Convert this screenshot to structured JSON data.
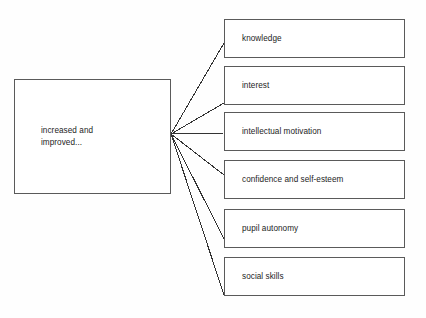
{
  "diagram": {
    "type": "radial-fan-flowchart",
    "title": "",
    "background_color": "#fefefe",
    "box_border_color": "#5a5a5a",
    "box_fill_color": "#ffffff",
    "connector_color": "#333333",
    "text_color": "#1d1d1d",
    "source": {
      "id": "source",
      "label": "increased and\nimproved...",
      "x": 14,
      "y": 79,
      "width": 157,
      "height": 115
    },
    "fan_origin": {
      "x": 171,
      "y": 134
    },
    "targets": [
      {
        "id": "knowledge",
        "label": "knowledge",
        "x": 224,
        "y": 19,
        "width": 181,
        "height": 39,
        "connector_end_x": 224,
        "connector_end_y": 43
      },
      {
        "id": "interest",
        "label": "interest",
        "x": 224,
        "y": 66,
        "width": 181,
        "height": 39,
        "connector_end_x": 224,
        "connector_end_y": 103
      },
      {
        "id": "intellectual-motivation",
        "label": "intellectual motivation",
        "x": 224,
        "y": 112,
        "width": 181,
        "height": 39,
        "connector_end_x": 224,
        "connector_end_y": 133
      },
      {
        "id": "confidence-and-self-esteem",
        "label": "confidence and self-esteem",
        "x": 224,
        "y": 160,
        "width": 181,
        "height": 39,
        "connector_end_x": 224,
        "connector_end_y": 175
      },
      {
        "id": "pupil-autonomy",
        "label": "pupil autonomy",
        "x": 224,
        "y": 209,
        "width": 181,
        "height": 39,
        "connector_end_x": 224,
        "connector_end_y": 239
      },
      {
        "id": "social-skills",
        "label": "social skills",
        "x": 224,
        "y": 257,
        "width": 181,
        "height": 39,
        "connector_end_x": 224,
        "connector_end_y": 295
      }
    ]
  }
}
